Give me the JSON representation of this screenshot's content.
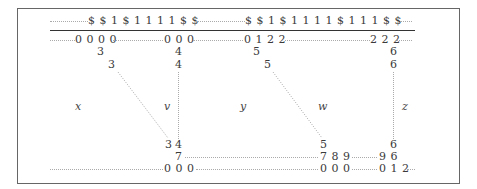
{
  "diagram": {
    "header_left": "$ $ 1 $ 1 1 1 1 $ $",
    "header_right": "$ $ 1 $ 1 1 1 1 $ 1 1 1 $ $",
    "row1": {
      "a": "0 0 0 0",
      "b": "0 0 0",
      "c": "0 1 2 2",
      "d": "2 2 2"
    },
    "col_x": {
      "r2": "3",
      "r3": "3",
      "r_bottom": "3"
    },
    "col_v": {
      "r2": "4",
      "r3": "4",
      "r_bottom": "4",
      "r_7": "7"
    },
    "col_y": {
      "r2": "5",
      "r3": "5",
      "r_bottom": "5"
    },
    "col_z": {
      "r2": "6",
      "r3": "6",
      "r_bottom": "6"
    },
    "labels": {
      "x": "x",
      "v": "v",
      "y": "y",
      "w": "w",
      "z": "z"
    },
    "row_789": "7 8 9",
    "row_96": "9 6",
    "bottom": {
      "a": "0 0 0",
      "b": "0 0 0",
      "c": "0 1 2"
    }
  }
}
